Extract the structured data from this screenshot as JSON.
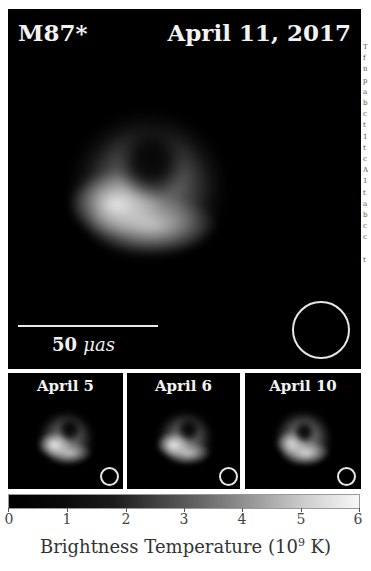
{
  "chart_data": {
    "type": "heatmap",
    "title": "M87* April 11, 2017",
    "panels": [
      {
        "label": "April 11, 2017",
        "object": "M87*",
        "role": "main",
        "beam": "circle"
      },
      {
        "label": "April 5",
        "role": "inset",
        "beam": "circle"
      },
      {
        "label": "April 6",
        "role": "inset",
        "beam": "circle"
      },
      {
        "label": "April 10",
        "role": "inset",
        "beam": "circle"
      }
    ],
    "scale_bar": {
      "value": 50,
      "unit": "μas",
      "label": "50 μas"
    },
    "colorbar": {
      "label": "Brightness Temperature (10^9 K)",
      "range": [
        0,
        6
      ],
      "ticks": [
        0,
        1,
        2,
        3,
        4,
        5,
        6
      ],
      "colormap": "grayscale (black to white)"
    },
    "xlabel": "Brightness Temperature (10^9 K)",
    "grid": false,
    "legend": "none"
  },
  "main": {
    "object_label": "M87*",
    "date_label": "April 11, 2017",
    "scale_value": "50",
    "scale_unit": "μas"
  },
  "insets": [
    {
      "label": "April 5"
    },
    {
      "label": "April 6"
    },
    {
      "label": "April 10"
    }
  ],
  "colorbar": {
    "ticks": [
      "0",
      "1",
      "2",
      "3",
      "4",
      "5",
      "6"
    ],
    "label_prefix": "Brightness Temperature (10",
    "label_exp": "9",
    "label_suffix": " K)"
  },
  "caption_fragment": [
    "T",
    "f",
    "n",
    "p",
    "a",
    "b",
    "c",
    "t",
    "1",
    "t",
    "c",
    "A",
    "1",
    "t",
    "a",
    "b",
    "c",
    "c",
    "",
    "t"
  ]
}
